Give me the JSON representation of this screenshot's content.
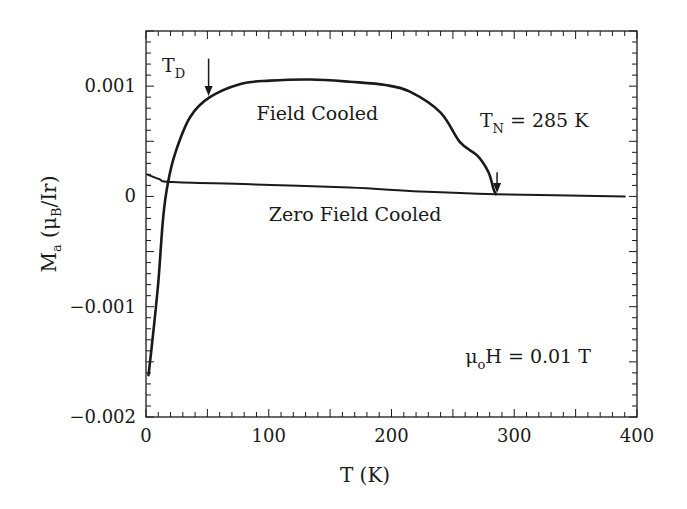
{
  "chart_data": {
    "type": "line",
    "title": "",
    "xlabel": "T (K)",
    "ylabel": "M_a (μ_B/Ir)",
    "ylabel_parts": {
      "main": "M",
      "main_sub": "a",
      "open": " (μ",
      "unit_sub": "B",
      "close": "/Ir)"
    },
    "xlim": [
      0,
      400
    ],
    "ylim": [
      -0.002,
      0.0015
    ],
    "x_ticks": [
      0,
      100,
      200,
      300,
      400
    ],
    "x_tick_labels": [
      "0",
      "100",
      "200",
      "300",
      "400"
    ],
    "x_minor_step": 10,
    "y_ticks": [
      -0.002,
      -0.001,
      0,
      0.001
    ],
    "y_tick_labels": [
      "-0.002",
      "-0.001",
      "0",
      "0.001"
    ],
    "y_minor_step": 0.0001,
    "grid": false,
    "legend": null,
    "series": [
      {
        "name": "Field Cooled",
        "color": "#1a1a1a",
        "x": [
          2,
          5,
          10,
          14,
          18,
          24,
          36,
          52,
          77,
          101,
          134,
          166,
          195,
          215,
          240,
          256,
          270,
          279,
          283,
          285
        ],
        "y": [
          -0.00162,
          -0.00133,
          -0.00078,
          -0.00019,
          0.00013,
          0.0004,
          0.00072,
          0.0009,
          0.00102,
          0.00105,
          0.00106,
          0.00104,
          0.00101,
          0.00095,
          0.00076,
          0.00049,
          0.00037,
          0.00022,
          7e-05,
          2e-05
        ]
      },
      {
        "name": "Zero Field Cooled",
        "color": "#1a1a1a",
        "x": [
          1,
          11,
          21,
          85,
          166,
          223,
          285,
          390
        ],
        "y": [
          0.0002,
          0.000155,
          0.00013,
          0.00011,
          8e-05,
          4.5e-05,
          2e-05,
          0.0
        ]
      }
    ],
    "annotations": [
      {
        "name": "td-label",
        "text": "T",
        "sub": "D",
        "x": 13,
        "y": 0.00113
      },
      {
        "name": "td-arrow",
        "type": "arrow",
        "x": 51,
        "y_from": 0.00125,
        "y_to": 0.00091
      },
      {
        "name": "field-cooled-label",
        "text": "Field Cooled",
        "x": 90,
        "y": 0.00069
      },
      {
        "name": "tn-label",
        "text": "T",
        "sub": "N",
        "suffix": " = 285 K",
        "x": 272,
        "y": 0.00063
      },
      {
        "name": "tn-arrow",
        "type": "arrow",
        "x": 286,
        "y_from": 0.00022,
        "y_to": 3e-05
      },
      {
        "name": "zero-field-cooled-label",
        "text": "Zero Field Cooled",
        "x": 100,
        "y": -0.00022
      },
      {
        "name": "field-label",
        "text": "μ",
        "sub": "o",
        "suffix": "H = 0.01 T",
        "x": 260,
        "y": -0.00151
      }
    ]
  }
}
